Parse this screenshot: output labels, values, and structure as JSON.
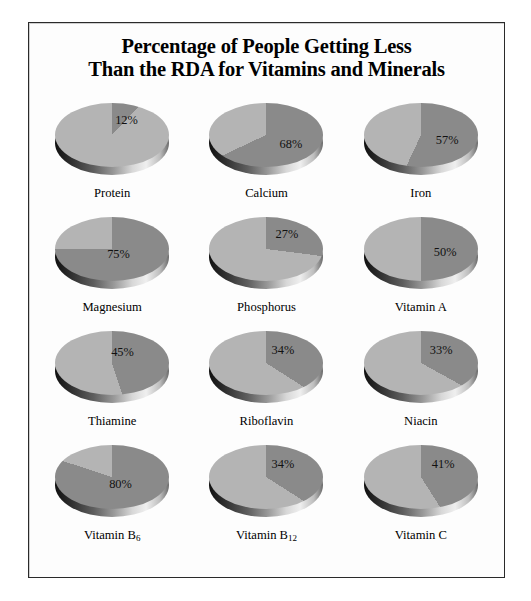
{
  "chart_data": {
    "type": "pie",
    "title": "Percentage of People Getting Less Than the RDA for Vitamins and Minerals",
    "title_lines": [
      "Percentage of People Getting Less",
      "Than the RDA for Vitamins and Minerals"
    ],
    "xlabel": "",
    "ylabel": "",
    "grid": false,
    "legend": "none",
    "layout": {
      "rows": 4,
      "cols": 3
    },
    "colors": {
      "slice_deficient": "#8a8a8a",
      "slice_remainder": "#b4b4b4",
      "frame_border": "#2a2a2a",
      "background": "#fdfdfd",
      "text": "#000000"
    },
    "series_name": "Percent getting less than the RDA",
    "categories": [
      "Protein",
      "Calcium",
      "Iron",
      "Magnesium",
      "Phosphorus",
      "Vitamin A",
      "Thiamine",
      "Riboflavin",
      "Niacin",
      "Vitamin B6",
      "Vitamin B12",
      "Vitamin C"
    ],
    "values": [
      12,
      68,
      57,
      75,
      27,
      50,
      45,
      34,
      33,
      80,
      34,
      41
    ],
    "pies": [
      {
        "label": "Protein",
        "label_html": "Protein",
        "value": 12,
        "value_text": "12%",
        "start_deg": 0,
        "value_x": 64,
        "value_y": 16
      },
      {
        "label": "Calcium",
        "label_html": "Calcium",
        "value": 68,
        "value_text": "68%",
        "start_deg": 0,
        "value_x": 74,
        "value_y": 40
      },
      {
        "label": "Iron",
        "label_html": "Iron",
        "value": 57,
        "value_text": "57%",
        "start_deg": 0,
        "value_x": 76,
        "value_y": 36
      },
      {
        "label": "Magnesium",
        "label_html": "Magnesium",
        "value": 75,
        "value_text": "75%",
        "start_deg": 0,
        "value_x": 56,
        "value_y": 36
      },
      {
        "label": "Phosphorus",
        "label_html": "Phosphorus",
        "value": 27,
        "value_text": "27%",
        "start_deg": 0,
        "value_x": 70,
        "value_y": 16
      },
      {
        "label": "Vitamin A",
        "label_html": "Vitamin A",
        "value": 50,
        "value_text": "50%",
        "start_deg": 0,
        "value_x": 74,
        "value_y": 34
      },
      {
        "label": "Thiamine",
        "label_html": "Thiamine",
        "value": 45,
        "value_text": "45%",
        "start_deg": 0,
        "value_x": 60,
        "value_y": 20
      },
      {
        "label": "Riboflavin",
        "label_html": "Riboflavin",
        "value": 34,
        "value_text": "34%",
        "start_deg": 0,
        "value_x": 66,
        "value_y": 18
      },
      {
        "label": "Niacin",
        "label_html": "Niacin",
        "value": 33,
        "value_text": "33%",
        "start_deg": 0,
        "value_x": 70,
        "value_y": 18
      },
      {
        "label": "Vitamin B6",
        "label_html": "Vitamin B<sub>6</sub>",
        "value": 80,
        "value_text": "80%",
        "start_deg": 0,
        "value_x": 58,
        "value_y": 38
      },
      {
        "label": "Vitamin B12",
        "label_html": "Vitamin B<sub>12</sub>",
        "value": 34,
        "value_text": "34%",
        "start_deg": 0,
        "value_x": 66,
        "value_y": 18
      },
      {
        "label": "Vitamin C",
        "label_html": "Vitamin C",
        "value": 41,
        "value_text": "41%",
        "start_deg": 0,
        "value_x": 72,
        "value_y": 18
      }
    ]
  }
}
